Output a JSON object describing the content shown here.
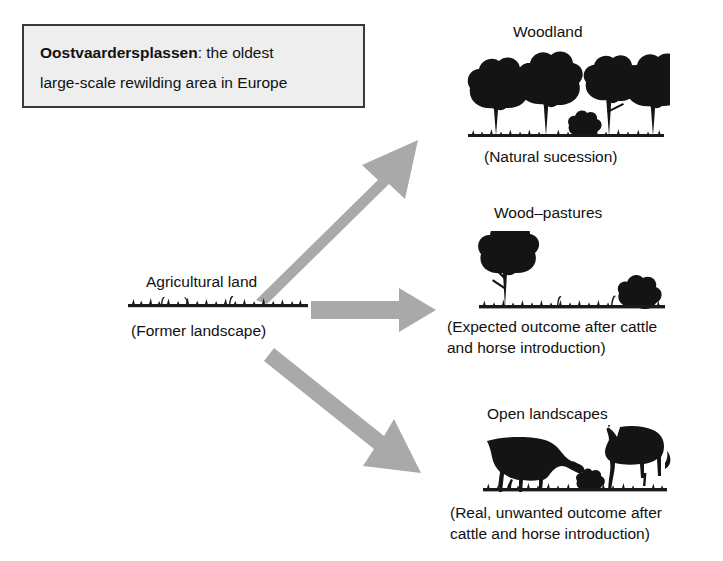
{
  "callout": {
    "line1_bold": "Oostvaardersplassen",
    "line1_rest": ": the oldest",
    "line2": "large-scale rewilding area in Europe"
  },
  "source_node": {
    "title": "Agricultural land",
    "caption": "(Former landscape)",
    "icon": "grass-strip-icon"
  },
  "outcomes": [
    {
      "id": "woodland",
      "title": "Woodland",
      "caption_lines": [
        "(Natural sucession)"
      ],
      "icon": "woodland-trees-icon"
    },
    {
      "id": "wood-pastures",
      "title": "Wood–pastures",
      "caption_lines": [
        "(Expected outcome after cattle",
        "and horse introduction)"
      ],
      "icon": "wood-pasture-tree-shrub-icon"
    },
    {
      "id": "open-landscapes",
      "title": "Open landscapes",
      "caption_lines": [
        "(Real, unwanted outcome after",
        "cattle and horse introduction)"
      ],
      "icon": "cow-and-horse-icon"
    }
  ],
  "arrows": [
    {
      "id": "arrow-to-woodland",
      "direction": "up-right",
      "name": "arrow-agricultural-to-woodland"
    },
    {
      "id": "arrow-to-wood-pastures",
      "direction": "right",
      "name": "arrow-agricultural-to-wood-pastures"
    },
    {
      "id": "arrow-to-open-landscapes",
      "direction": "down-right",
      "name": "arrow-agricultural-to-open-landscapes"
    }
  ],
  "colors": {
    "arrow_fill": "#a9a9a9",
    "silhouette": "#141414",
    "callout_background": "#eeeeee",
    "callout_border": "#3a3a3a",
    "page_background": "#ffffff"
  }
}
